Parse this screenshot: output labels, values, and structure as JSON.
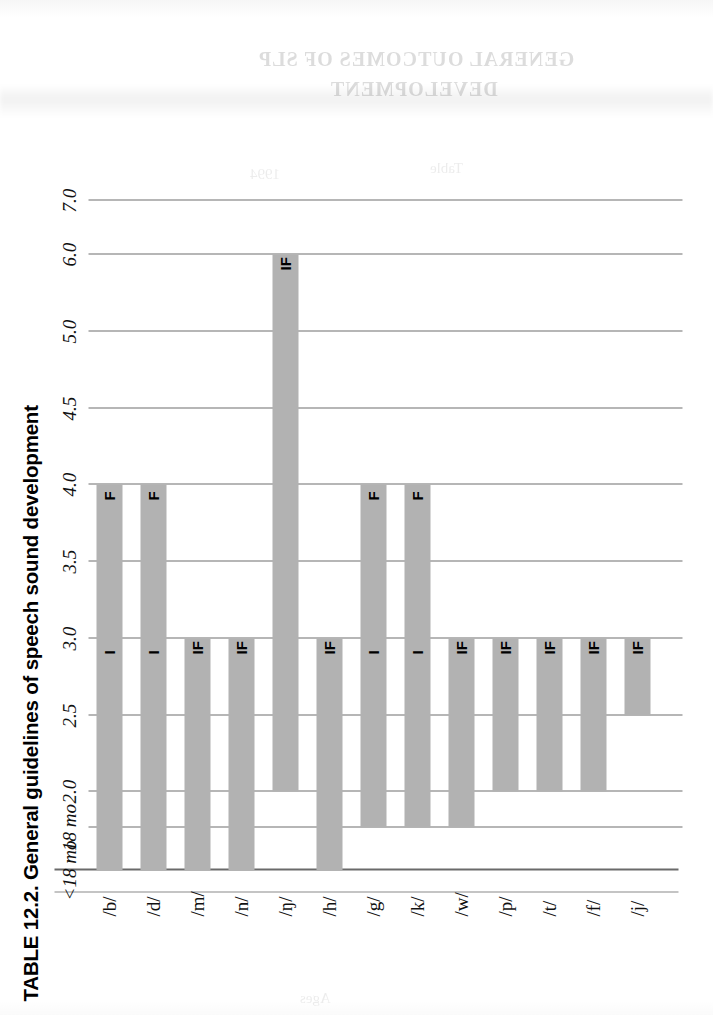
{
  "page": {
    "background_color": "#ffffff",
    "ghost_showthrough": {
      "line1": "GENERAL OUTCOMES OF SLP",
      "line2": "DEVELOPMENT",
      "faint1": "Table",
      "faint2": "1994",
      "faint3": "Ages"
    }
  },
  "figure": {
    "title": "TABLE 12.2. General guidelines of speech sound development",
    "bar_color": "#b2b2b2",
    "gridline_color": "#6f6f6f",
    "axis_color": "#6a6a6a"
  },
  "chart_data": {
    "type": "bar",
    "orientation": "horizontal",
    "title": "TABLE 12.2. General guidelines of speech sound development",
    "xlabel": "",
    "ylabel": "",
    "grid": true,
    "legend": null,
    "axis_tick_labels": [
      "<18 mo",
      "18 mo",
      "2.0",
      "2.5",
      "3.0",
      "3.5",
      "4.0",
      "4.5",
      "5.0",
      "6.0",
      "7.0"
    ],
    "axis_tick_values": [
      1.25,
      1.5,
      2.0,
      2.5,
      3.0,
      3.5,
      4.0,
      4.5,
      5.0,
      6.0,
      7.0
    ],
    "xlim": [
      1.25,
      7.0
    ],
    "categories": [
      "/b/",
      "/d/",
      "/m/",
      "/n/",
      "/ŋ/",
      "/h/",
      "/g/",
      "/k/",
      "/w/",
      "/p/",
      "/t/",
      "/f/",
      "/j/"
    ],
    "bars": [
      {
        "category": "/b/",
        "start": 1.25,
        "end": 4.0,
        "annotations": [
          {
            "label": "I",
            "at": 3.0
          },
          {
            "label": "F",
            "at": 4.0
          }
        ]
      },
      {
        "category": "/d/",
        "start": 1.25,
        "end": 4.0,
        "annotations": [
          {
            "label": "I",
            "at": 3.0
          },
          {
            "label": "F",
            "at": 4.0
          }
        ]
      },
      {
        "category": "/m/",
        "start": 1.25,
        "end": 3.0,
        "annotations": [
          {
            "label": "IF",
            "at": 3.0
          }
        ]
      },
      {
        "category": "/n/",
        "start": 1.25,
        "end": 3.0,
        "annotations": [
          {
            "label": "IF",
            "at": 3.0
          }
        ]
      },
      {
        "category": "/ŋ/",
        "start": 2.0,
        "end": 6.0,
        "annotations": [
          {
            "label": "IF",
            "at": 6.0
          }
        ]
      },
      {
        "category": "/h/",
        "start": 1.25,
        "end": 3.0,
        "annotations": [
          {
            "label": "IF",
            "at": 3.0
          }
        ]
      },
      {
        "category": "/g/",
        "start": 1.5,
        "end": 4.0,
        "annotations": [
          {
            "label": "I",
            "at": 3.0
          },
          {
            "label": "F",
            "at": 4.0
          }
        ]
      },
      {
        "category": "/k/",
        "start": 1.5,
        "end": 4.0,
        "annotations": [
          {
            "label": "I",
            "at": 3.0
          },
          {
            "label": "F",
            "at": 4.0
          }
        ]
      },
      {
        "category": "/w/",
        "start": 1.5,
        "end": 3.0,
        "annotations": [
          {
            "label": "IF",
            "at": 3.0
          }
        ]
      },
      {
        "category": "/p/",
        "start": 2.0,
        "end": 3.0,
        "annotations": [
          {
            "label": "IF",
            "at": 3.0
          }
        ]
      },
      {
        "category": "/t/",
        "start": 2.0,
        "end": 3.0,
        "annotations": [
          {
            "label": "IF",
            "at": 3.0
          }
        ]
      },
      {
        "category": "/f/",
        "start": 2.0,
        "end": 3.0,
        "annotations": [
          {
            "label": "IF",
            "at": 3.0
          }
        ]
      },
      {
        "category": "/j/",
        "start": 2.5,
        "end": 3.0,
        "annotations": [
          {
            "label": "IF",
            "at": 3.0
          }
        ]
      }
    ]
  }
}
